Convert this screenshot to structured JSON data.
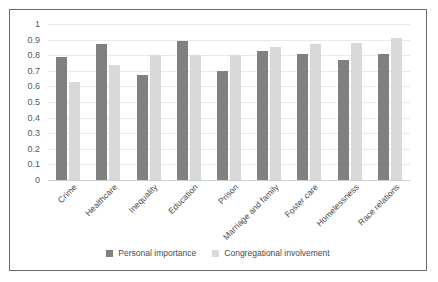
{
  "chart_data": {
    "type": "bar",
    "title": "",
    "subtitle": "",
    "xlabel": "",
    "ylabel": "",
    "ylim": [
      0,
      1
    ],
    "ytick_labels": [
      "1",
      "0.9",
      "0.8",
      "0.7",
      "0.6",
      "0.5",
      "0.4",
      "0.3",
      "0.2",
      "0.1",
      "0"
    ],
    "ytick_values": [
      1,
      0.9,
      0.8,
      0.7,
      0.6,
      0.5,
      0.4,
      0.3,
      0.2,
      0.1,
      0
    ],
    "grid": true,
    "legend_position": "bottom",
    "categories": [
      "Crime",
      "Healthcare",
      "Inequality",
      "Education",
      "Prison",
      "Marriage and family",
      "Foster care",
      "Homelessness",
      "Race relations"
    ],
    "series": [
      {
        "name": "Personal importance",
        "color": "#808080",
        "values": [
          0.79,
          0.87,
          0.67,
          0.89,
          0.7,
          0.83,
          0.81,
          0.77,
          0.81
        ]
      },
      {
        "name": "Congregational involvement",
        "color": "#d9d9d9",
        "values": [
          0.63,
          0.74,
          0.8,
          0.8,
          0.8,
          0.85,
          0.87,
          0.88,
          0.91
        ]
      }
    ]
  },
  "colors": {
    "series_personal_importance": "#808080",
    "series_congregational_involvement": "#d9d9d9",
    "gridline": "#e9e9e9",
    "border": "#6b6b6b",
    "axis_text": "#5a5a5a",
    "background": "#ffffff"
  }
}
